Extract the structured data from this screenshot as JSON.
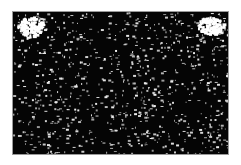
{
  "image": {
    "description": "Black rectangle filled with scattered white noise specks, with dense white blob clusters in the top-left and top-right corners",
    "background_color": "#ffffff",
    "field_color": "#050505",
    "speck_color": "#f0f0f0",
    "frame": {
      "x": 12,
      "y": 11,
      "width": 217,
      "height": 144
    },
    "speck_count": 900,
    "seed": 7,
    "blobs": [
      {
        "name": "top-left-cluster",
        "x": 4,
        "y": 4,
        "w": 26,
        "h": 22
      },
      {
        "name": "top-right-cluster",
        "x": 186,
        "y": 4,
        "w": 26,
        "h": 18
      }
    ]
  }
}
